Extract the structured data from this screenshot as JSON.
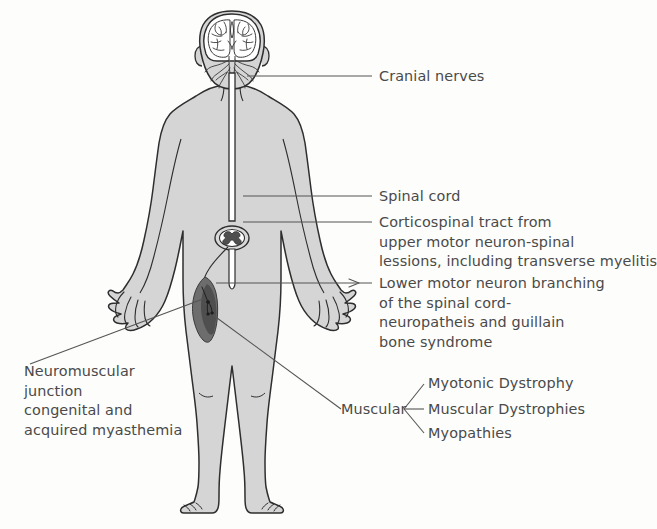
{
  "diagram": {
    "figure_name": "human-body-anterior-view",
    "colors": {
      "background": "#fdfdfb",
      "body_fill": "#d5d5d5",
      "body_fill_light": "#dedede",
      "outline": "#2e2e2e",
      "muscle_dark": "#6d6d6d",
      "muscle_darker": "#4f4f4f",
      "text": "#4a4a4a",
      "leader_line": "#555555"
    }
  },
  "labels": {
    "cranial_nerves": {
      "lines": [
        "Cranial nerves"
      ]
    },
    "spinal_cord": {
      "lines": [
        "Spinal cord"
      ]
    },
    "corticospinal_tract": {
      "lines": [
        "Corticospinal tract from",
        "upper motor neuron-spinal",
        "lessions, including transverse myelitis"
      ]
    },
    "lower_motor_neuron": {
      "lines": [
        "Lower motor neuron branching",
        "of the spinal cord-",
        "neuropatheis and guillain",
        "bone syndrome"
      ]
    },
    "neuromuscular_junction": {
      "lines": [
        "Neuromuscular",
        "junction",
        "congenital and",
        "acquired myasthemia"
      ]
    },
    "muscular": {
      "label": "Muscular",
      "branches": [
        "Myotonic Dystrophy",
        "Muscular Dystrophies",
        "Myopathies"
      ]
    }
  },
  "anatomy_parts": [
    "brain",
    "cranial-nerve-branches",
    "spinal-cord",
    "spinal-cord-cross-section",
    "thigh-muscle",
    "neuromuscular-junction-detail"
  ]
}
